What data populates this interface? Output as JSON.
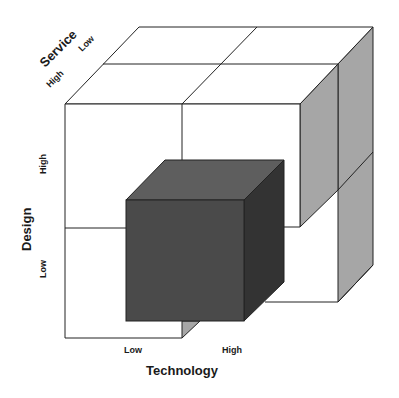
{
  "diagram": {
    "type": "3x3 cube matrix (2x2x2)",
    "axes": {
      "x": {
        "title": "Technology",
        "low": "Low",
        "high": "High"
      },
      "y": {
        "title": "Design",
        "low": "Low",
        "high": "High"
      },
      "z": {
        "title": "Service",
        "low": "Low",
        "high": "High"
      }
    },
    "highlighted_cell": {
      "technology": "Low",
      "design": "Low",
      "service": "High",
      "shade": "dark"
    },
    "colors": {
      "background": "#ffffff",
      "line": "#222222",
      "dark_front": "#4a4a4a",
      "dark_top": "#5e5e5e",
      "dark_side": "#333333",
      "light_side": "#a6a6a6",
      "white_face": "#ffffff"
    }
  }
}
